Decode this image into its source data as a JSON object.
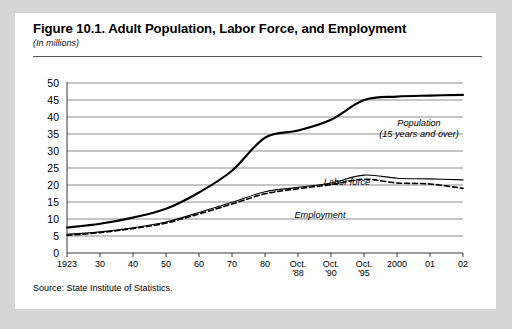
{
  "figure": {
    "title": "Figure 10.1.  Adult Population, Labor Force, and Employment",
    "subtitle": "(In millions)",
    "source": "Source: State Institute of Statistics."
  },
  "annotations": {
    "population_line1": "Population",
    "population_line2": "(15 years and over)",
    "labor_force": "Labor force",
    "employment": "Employment"
  },
  "colors": {
    "page_background": "#d6d6d6",
    "card_background": "#ffffff",
    "gridline": "#8d8d8d",
    "axis": "#3a3a3a",
    "series": "#000000"
  },
  "chart_data": {
    "type": "line",
    "title": "Figure 10.1.  Adult Population, Labor Force, and Employment",
    "subtitle": "(In millions)",
    "xlabel": "",
    "ylabel": "",
    "ylim": [
      0,
      50
    ],
    "ytick_step": 5,
    "yticks": [
      "50",
      "45",
      "40",
      "35",
      "30",
      "25",
      "20",
      "15",
      "10",
      "5",
      "0"
    ],
    "grid": true,
    "legend": "annotations-inline",
    "categories": [
      "1923",
      "30",
      "40",
      "50",
      "60",
      "70",
      "80",
      "Oct.\n'88",
      "Oct.\n'90",
      "Oct.\n'95",
      "2000",
      "01",
      "02"
    ],
    "xtick_labels": [
      {
        "line1": "1923",
        "line2": ""
      },
      {
        "line1": "30",
        "line2": ""
      },
      {
        "line1": "40",
        "line2": ""
      },
      {
        "line1": "50",
        "line2": ""
      },
      {
        "line1": "60",
        "line2": ""
      },
      {
        "line1": "70",
        "line2": ""
      },
      {
        "line1": "80",
        "line2": ""
      },
      {
        "line1": "Oct.",
        "line2": "'88"
      },
      {
        "line1": "Oct.",
        "line2": "'90"
      },
      {
        "line1": "Oct.",
        "line2": "'95"
      },
      {
        "line1": "2000",
        "line2": ""
      },
      {
        "line1": "01",
        "line2": ""
      },
      {
        "line1": "02",
        "line2": ""
      }
    ],
    "series": [
      {
        "name": "Population (15 years and over)",
        "style": "solid",
        "width": 2.1,
        "values": [
          7.5,
          8.6,
          10.4,
          13.0,
          17.8,
          24.2,
          33.9,
          36.0,
          39.2,
          45.0,
          46.0,
          46.3,
          46.5
        ]
      },
      {
        "name": "Labor force",
        "style": "solid",
        "width": 1.1,
        "values": [
          5.5,
          6.2,
          7.4,
          9.1,
          11.9,
          14.9,
          18.0,
          19.3,
          20.6,
          22.9,
          22.0,
          21.8,
          21.5
        ]
      },
      {
        "name": "Employment",
        "style": "dashed",
        "width": 1.6,
        "values": [
          5.2,
          6.0,
          7.2,
          8.8,
          11.5,
          14.4,
          17.4,
          18.9,
          20.1,
          21.7,
          20.6,
          20.3,
          19.0
        ]
      }
    ]
  }
}
